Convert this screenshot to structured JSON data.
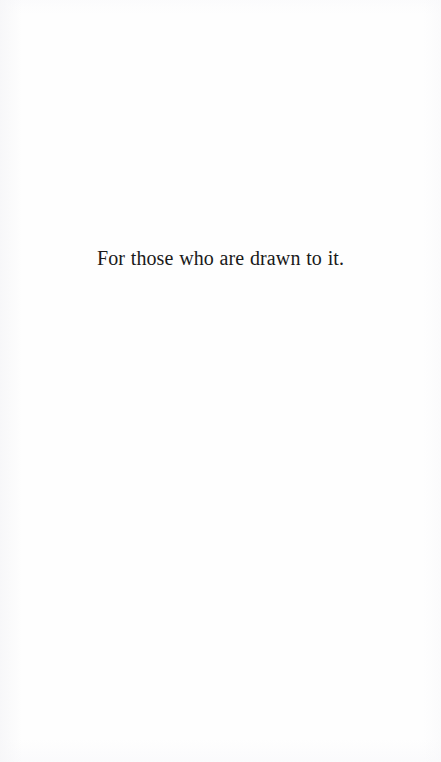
{
  "page": {
    "kind": "book-dedication-page",
    "background_color": "#fefefe",
    "text_color": "#1a1a1a"
  },
  "dedication": {
    "text": "For those who are drawn to it."
  }
}
